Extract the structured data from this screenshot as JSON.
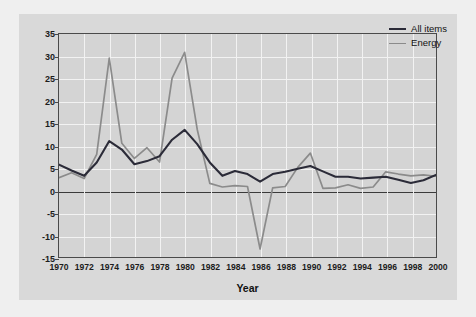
{
  "chart_data": {
    "type": "line",
    "title": "",
    "xlabel": "Year",
    "ylabel": "Change (percentage)",
    "xlim": [
      1970,
      2000
    ],
    "ylim": [
      -15,
      35
    ],
    "yticks": [
      35,
      30,
      25,
      20,
      15,
      10,
      5,
      0,
      -5,
      -10,
      -15
    ],
    "xticks": [
      1970,
      1972,
      1974,
      1976,
      1978,
      1980,
      1982,
      1984,
      1986,
      1988,
      1990,
      1992,
      1994,
      1996,
      1998,
      2000
    ],
    "grid": true,
    "legend_position": "top-right",
    "x": [
      1970,
      1971,
      1972,
      1973,
      1974,
      1975,
      1976,
      1977,
      1978,
      1979,
      1980,
      1981,
      1982,
      1983,
      1984,
      1985,
      1986,
      1987,
      1988,
      1989,
      1990,
      1991,
      1992,
      1993,
      1994,
      1995,
      1996,
      1997,
      1998,
      1999,
      2000
    ],
    "series": [
      {
        "name": "All items",
        "color": "#2b2b38",
        "values": [
          5.7,
          4.4,
          3.2,
          6.2,
          11.0,
          9.1,
          5.8,
          6.5,
          7.6,
          11.3,
          13.5,
          10.3,
          6.2,
          3.2,
          4.3,
          3.6,
          1.9,
          3.6,
          4.1,
          4.8,
          5.4,
          4.2,
          3.0,
          3.0,
          2.6,
          2.8,
          3.0,
          2.3,
          1.6,
          2.2,
          3.4
        ]
      },
      {
        "name": "Energy",
        "color": "#8b8b8b",
        "values": [
          2.8,
          3.9,
          2.6,
          8.0,
          29.6,
          10.5,
          7.1,
          9.5,
          6.3,
          25.1,
          30.9,
          13.6,
          1.5,
          0.7,
          1.0,
          0.8,
          -13.2,
          0.5,
          0.8,
          5.1,
          8.3,
          0.4,
          0.5,
          1.2,
          0.4,
          0.7,
          4.1,
          3.6,
          3.2,
          3.4,
          3.1
        ]
      }
    ]
  },
  "legend": {
    "items": [
      {
        "label": "All items",
        "color": "#2b2b38"
      },
      {
        "label": "Energy",
        "color": "#8b8b8b"
      }
    ]
  },
  "axes": {
    "y_title": "Change (percentage)",
    "x_title": "Year"
  }
}
